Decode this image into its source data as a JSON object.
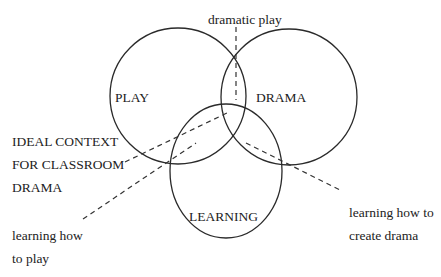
{
  "diagram": {
    "type": "venn",
    "colors": {
      "stroke": "#2a2a2a",
      "text": "#222222",
      "background": "#ffffff"
    },
    "circles": [
      {
        "id": "play",
        "label": "PLAY"
      },
      {
        "id": "drama",
        "label": "DRAMA"
      },
      {
        "id": "learning",
        "label": "LEARNING"
      }
    ],
    "annotations": {
      "dramatic_play": "dramatic play",
      "ideal_context": [
        "IDEAL CONTEXT",
        "FOR CLASSROOM",
        "DRAMA"
      ],
      "learning_play": [
        "learning how",
        "to play"
      ],
      "learning_drama": [
        "learning how to",
        "create drama"
      ]
    }
  }
}
